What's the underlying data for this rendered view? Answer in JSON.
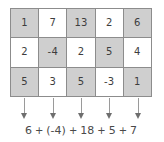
{
  "figure": {
    "colors": {
      "shaded_cell": "#cfcfcf",
      "plain_cell": "#ffffff",
      "grid_line": "#8c8c8c",
      "text": "#3d3d3d",
      "arrow": "#6e6e6e",
      "equation_text": "#4a4a4a"
    }
  },
  "grid": {
    "rows": 3,
    "columns": 5,
    "cells": [
      [
        {
          "value": "1",
          "shaded": true
        },
        {
          "value": "7",
          "shaded": false
        },
        {
          "value": "13",
          "shaded": true
        },
        {
          "value": "2",
          "shaded": false
        },
        {
          "value": "6",
          "shaded": true
        }
      ],
      [
        {
          "value": "2",
          "shaded": false
        },
        {
          "value": "-4",
          "shaded": true
        },
        {
          "value": "2",
          "shaded": false
        },
        {
          "value": "5",
          "shaded": true
        },
        {
          "value": "4",
          "shaded": false
        }
      ],
      [
        {
          "value": "5",
          "shaded": true
        },
        {
          "value": "3",
          "shaded": false
        },
        {
          "value": "5",
          "shaded": true
        },
        {
          "value": "-3",
          "shaded": false
        },
        {
          "value": "1",
          "shaded": true
        }
      ]
    ]
  },
  "arrows": [
    {
      "name": "arrow-column-1"
    },
    {
      "name": "arrow-column-2"
    },
    {
      "name": "arrow-column-3"
    },
    {
      "name": "arrow-column-4"
    },
    {
      "name": "arrow-column-5"
    }
  ],
  "equation": {
    "terms": [
      "6",
      "(-4)",
      "18",
      "5",
      "7"
    ],
    "operators": [
      "+",
      "+",
      "+",
      "+"
    ],
    "full_text": "6 + (-4) + 18 + 5 + 7"
  },
  "chart_data": {
    "type": "table",
    "title": "",
    "columns": [
      "c1",
      "c2",
      "c3",
      "c4",
      "c5"
    ],
    "rows": [
      [
        "1",
        "7",
        "13",
        "2",
        "6"
      ],
      [
        "2",
        "-4",
        "2",
        "5",
        "4"
      ],
      [
        "5",
        "3",
        "5",
        "-3",
        "1"
      ]
    ],
    "column_results": [
      "6",
      "(-4)",
      "18",
      "5",
      "7"
    ],
    "annotation": "6 + (-4) + 18 + 5 + 7"
  }
}
